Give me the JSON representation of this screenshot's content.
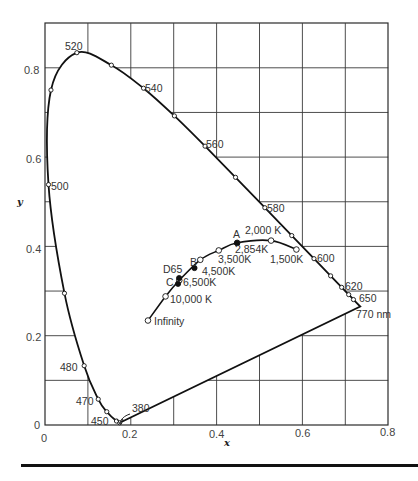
{
  "chart_data": {
    "type": "scatter",
    "xlabel": "x",
    "ylabel": "y",
    "xlim": [
      0,
      0.8
    ],
    "ylim": [
      0,
      0.9
    ],
    "grid": true,
    "x_ticks": [
      "0",
      "0.2",
      "0.4",
      "0.6",
      "0.8"
    ],
    "y_ticks": [
      "0",
      "0.2",
      "0.4",
      "0.6",
      "0.8"
    ],
    "spectral_locus": {
      "name": "Spectral locus (nm)",
      "points": [
        {
          "x": 0.1741,
          "y": 0.005,
          "label": "380"
        },
        {
          "x": 0.1666,
          "y": 0.0089,
          "label": "450"
        },
        {
          "x": 0.144,
          "y": 0.0297,
          "label": ""
        },
        {
          "x": 0.1241,
          "y": 0.0578,
          "label": "470"
        },
        {
          "x": 0.0913,
          "y": 0.1327,
          "label": "480"
        },
        {
          "x": 0.0454,
          "y": 0.295,
          "label": ""
        },
        {
          "x": 0.0082,
          "y": 0.5384,
          "label": "500"
        },
        {
          "x": 0.0139,
          "y": 0.7502,
          "label": ""
        },
        {
          "x": 0.0743,
          "y": 0.8338,
          "label": "520"
        },
        {
          "x": 0.1547,
          "y": 0.8059,
          "label": ""
        },
        {
          "x": 0.2296,
          "y": 0.7543,
          "label": "540"
        },
        {
          "x": 0.3016,
          "y": 0.6923,
          "label": ""
        },
        {
          "x": 0.3731,
          "y": 0.6245,
          "label": "560"
        },
        {
          "x": 0.4441,
          "y": 0.5547,
          "label": ""
        },
        {
          "x": 0.5125,
          "y": 0.4866,
          "label": "580"
        },
        {
          "x": 0.5752,
          "y": 0.4242,
          "label": ""
        },
        {
          "x": 0.627,
          "y": 0.3725,
          "label": "600"
        },
        {
          "x": 0.6658,
          "y": 0.334,
          "label": ""
        },
        {
          "x": 0.6915,
          "y": 0.3083,
          "label": "620"
        },
        {
          "x": 0.7079,
          "y": 0.292,
          "label": ""
        },
        {
          "x": 0.719,
          "y": 0.2809,
          "label": "650"
        },
        {
          "x": 0.7347,
          "y": 0.2653,
          "label": "770 nm"
        }
      ]
    },
    "planckian_locus": {
      "name": "Planckian locus",
      "points": [
        {
          "x": 0.586,
          "y": 0.393,
          "label": "1,500K"
        },
        {
          "x": 0.527,
          "y": 0.413,
          "label": "2,000 K"
        },
        {
          "x": 0.448,
          "y": 0.408,
          "label": "2,854K"
        },
        {
          "x": 0.405,
          "y": 0.391,
          "label": "3,500K"
        },
        {
          "x": 0.362,
          "y": 0.37,
          "label": "4,500K"
        },
        {
          "x": 0.313,
          "y": 0.324,
          "label": "6,500K"
        },
        {
          "x": 0.281,
          "y": 0.288,
          "label": "10,000 K"
        },
        {
          "x": 0.24,
          "y": 0.234,
          "label": "Infinity"
        }
      ]
    },
    "illuminants": [
      {
        "name": "A",
        "x": 0.4476,
        "y": 0.4074
      },
      {
        "name": "B",
        "x": 0.3484,
        "y": 0.3516
      },
      {
        "name": "C",
        "x": 0.3101,
        "y": 0.3162
      },
      {
        "name": "D65",
        "x": 0.3127,
        "y": 0.329
      }
    ]
  },
  "labels": {
    "x_axis_title": "x",
    "y_axis_title": "y",
    "wl_380": "380",
    "wl_450": "450",
    "wl_470": "470",
    "wl_480": "480",
    "wl_500": "500",
    "wl_520": "520",
    "wl_540": "540",
    "wl_560": "560",
    "wl_580": "580",
    "wl_600": "600",
    "wl_620": "620",
    "wl_650": "650",
    "wl_770": "770 nm",
    "t_1500": "1,500K",
    "t_2000": "2,000 K",
    "t_2854": "2,854K",
    "t_3500": "3,500K",
    "t_4500": "4,500K",
    "t_6500": "6,500K",
    "t_10000": "10,000 K",
    "t_inf": "Infinity",
    "ill_a": "A",
    "ill_b": "B",
    "ill_c": "C",
    "ill_d65": "D65",
    "tick_x_0": "0",
    "tick_x_02": "0.2",
    "tick_x_04": "0.4",
    "tick_x_06": "0.6",
    "tick_x_08": "0.8",
    "tick_y_0": "0",
    "tick_y_02": "0.2",
    "tick_y_04": "0.4",
    "tick_y_06": "0.6",
    "tick_y_08": "0.8"
  },
  "colors": {
    "line": "#1a1a1a",
    "grid": "#3a3a3a",
    "text": "#444444"
  }
}
